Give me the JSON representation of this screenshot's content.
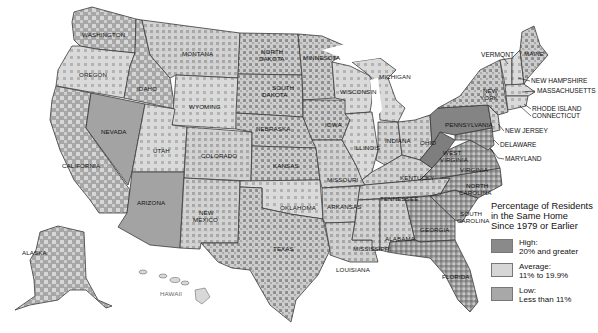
{
  "legend": {
    "title_lines": [
      "Percentage of Residents",
      "in the Same Home",
      "Since 1979 or Earlier"
    ],
    "items": [
      {
        "label": "High:",
        "range": "20% and greater",
        "color": "#8a8a8a"
      },
      {
        "label": "Average:",
        "range": "11% to 19.9%",
        "color": "#d6d6d6"
      },
      {
        "label": "Low:",
        "range": "Less than 11%",
        "color": "#a8a8a8"
      }
    ]
  },
  "states": {
    "washington": "WASHINGTON",
    "oregon": "OREGON",
    "california": "CALIFORNIA",
    "nevada": "NEVADA",
    "idaho": "IDAHO",
    "montana": "MONTANA",
    "wyoming": "WYOMING",
    "utah": "UTAH",
    "colorado": "COLORADO",
    "arizona": "ARIZONA",
    "new_mexico_1": "NEW",
    "new_mexico_2": "MEXICO",
    "north_dakota_1": "NORTH",
    "north_dakota_2": "DAKOTA",
    "south_dakota_1": "SOUTH",
    "south_dakota_2": "DAKOTA",
    "nebraska": "NEBRASKA",
    "kansas": "KANSAS",
    "oklahoma": "OKLAHOMA",
    "texas": "TEXAS",
    "minnesota": "MINNESOTA",
    "iowa": "IOWA",
    "missouri": "MISSOURI",
    "arkansas": "ARKANSAS",
    "louisiana": "LOUISIANA",
    "wisconsin": "WISCONSIN",
    "illinois": "ILLINOIS",
    "michigan": "MICHIGAN",
    "indiana": "INDIANA",
    "ohio": "OHIO",
    "kentucky": "KENTUCKY",
    "tennessee": "TENNESSEE",
    "mississippi": "MISSISSIPPI",
    "alabama": "ALABAMA",
    "georgia": "GEORGIA",
    "florida": "FLORIDA",
    "south_carolina_1": "SOUTH",
    "south_carolina_2": "CAROLINA",
    "north_carolina_1": "NORTH",
    "north_carolina_2": "CAROLINA",
    "virginia": "VIRGINIA",
    "west_virginia_1": "WEST",
    "west_virginia_2": "VIRGINIA",
    "pennsylvania": "PENNSYLVANIA",
    "new_york_1": "NEW",
    "new_york_2": "YORK",
    "vermont": "VERMONT",
    "maine": "MAINE",
    "new_hampshire": "NEW HAMPSHIRE",
    "massachusetts": "MASSACHUSETTS",
    "rhode_island": "RHODE ISLAND",
    "connecticut": "CONNECTICUT",
    "new_jersey": "NEW JERSEY",
    "delaware": "DELAWARE",
    "maryland": "MARYLAND",
    "alaska": "ALASKA",
    "hawaii": "HAWAII"
  },
  "colors": {
    "high": "#8a8a8a",
    "average": "#d6d6d6",
    "low": "#a8a8a8",
    "border": "#3a3a3a",
    "background": "#ffffff"
  }
}
